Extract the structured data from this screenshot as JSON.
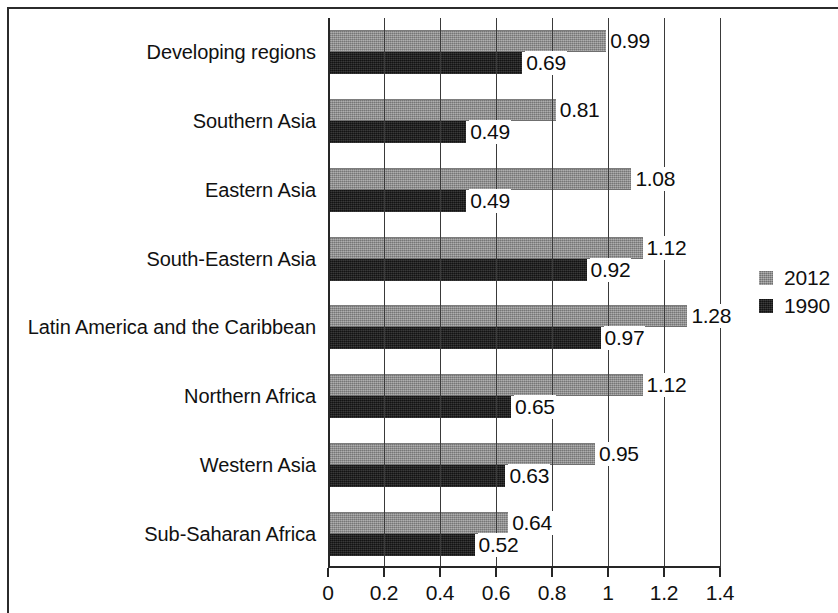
{
  "chart_data": {
    "type": "bar",
    "orientation": "horizontal",
    "title": "",
    "subtitle": "",
    "xlabel": "",
    "ylabel": "",
    "xlim": [
      0,
      1.4
    ],
    "xticks": [
      "0",
      "0.2",
      "0.4",
      "0.6",
      "0.8",
      "1",
      "1.2",
      "1.4"
    ],
    "xtick_values": [
      0,
      0.2,
      0.4,
      0.6,
      0.8,
      1,
      1.2,
      1.4
    ],
    "grid": "vertical",
    "legend_position": "right",
    "categories": [
      "Developing regions",
      "Southern Asia",
      "Eastern Asia",
      "South-Eastern Asia",
      "Latin America and the Caribbean",
      "Northern Africa",
      "Western Asia",
      "Sub-Saharan Africa"
    ],
    "series": [
      {
        "name": "2012",
        "color": "#8e8e8e",
        "values": [
          0.99,
          0.81,
          1.08,
          1.12,
          1.28,
          1.12,
          0.95,
          0.64
        ],
        "labels": [
          "0.99",
          "0.81",
          "1.08",
          "1.12",
          "1.28",
          "1.12",
          "0.95",
          "0.64"
        ]
      },
      {
        "name": "1990",
        "color": "#1d1d1d",
        "values": [
          0.69,
          0.49,
          0.49,
          0.92,
          0.97,
          0.65,
          0.63,
          0.52
        ],
        "labels": [
          "0.69",
          "0.49",
          "0.49",
          "0.92",
          "0.97",
          "0.65",
          "0.63",
          "0.52"
        ]
      }
    ]
  },
  "legend": {
    "entries": [
      {
        "label": "2012",
        "key": "y2012"
      },
      {
        "label": "1990",
        "key": "y1990"
      }
    ]
  }
}
